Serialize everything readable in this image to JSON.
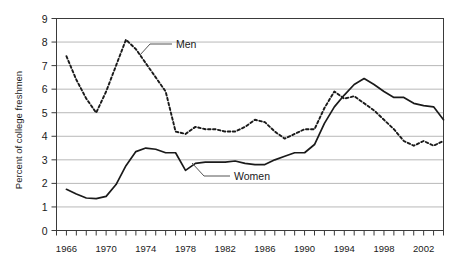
{
  "chart_data": {
    "type": "line",
    "title": "",
    "xlabel": "",
    "ylabel": "Percent of college freshmen",
    "xlim": [
      1965,
      2004
    ],
    "ylim": [
      0,
      9
    ],
    "yticks": [
      0,
      1,
      2,
      3,
      4,
      5,
      6,
      7,
      8,
      9
    ],
    "ytick_labels": [
      "0",
      "1",
      "2",
      "3",
      "4",
      "5",
      "6",
      "7",
      "8",
      "9"
    ],
    "xticks": [
      1966,
      1970,
      1974,
      1978,
      1982,
      1986,
      1990,
      1994,
      1998,
      2002
    ],
    "xtick_labels": [
      "1966",
      "1970",
      "1974",
      "1978",
      "1982",
      "1986",
      "1990",
      "1994",
      "1998",
      "2002"
    ],
    "xtick_minor_step": 1,
    "grid": "horizontal",
    "legend_position": "inline-annotations",
    "series": [
      {
        "name": "Men",
        "style": "dashed",
        "color": "#1a1a1a",
        "x": [
          1966,
          1967,
          1968,
          1969,
          1970,
          1971,
          1972,
          1973,
          1974,
          1975,
          1976,
          1977,
          1978,
          1979,
          1980,
          1981,
          1982,
          1983,
          1984,
          1985,
          1986,
          1987,
          1988,
          1989,
          1990,
          1991,
          1992,
          1993,
          1994,
          1995,
          1996,
          1997,
          1998,
          1999,
          2000,
          2001,
          2002,
          2003,
          2004
        ],
        "values": [
          7.4,
          6.4,
          5.6,
          5.0,
          5.9,
          7.0,
          8.1,
          7.7,
          7.1,
          6.5,
          5.9,
          4.2,
          4.1,
          4.4,
          4.3,
          4.3,
          4.2,
          4.2,
          4.4,
          4.7,
          4.6,
          4.2,
          3.9,
          4.1,
          4.3,
          4.3,
          5.2,
          5.9,
          5.6,
          5.7,
          5.4,
          5.1,
          4.7,
          4.3,
          3.8,
          3.6,
          3.8,
          3.6,
          3.8
        ]
      },
      {
        "name": "Women",
        "style": "solid",
        "color": "#1a1a1a",
        "x": [
          1966,
          1967,
          1968,
          1969,
          1970,
          1971,
          1972,
          1973,
          1974,
          1975,
          1976,
          1977,
          1978,
          1979,
          1980,
          1981,
          1982,
          1983,
          1984,
          1985,
          1986,
          1987,
          1988,
          1989,
          1990,
          1991,
          1992,
          1993,
          1994,
          1995,
          1996,
          1997,
          1998,
          1999,
          2000,
          2001,
          2002,
          2003,
          2004
        ],
        "values": [
          1.75,
          1.55,
          1.38,
          1.35,
          1.45,
          1.95,
          2.75,
          3.35,
          3.5,
          3.45,
          3.3,
          3.3,
          2.55,
          2.85,
          2.9,
          2.9,
          2.9,
          2.95,
          2.85,
          2.8,
          2.8,
          3.0,
          3.15,
          3.3,
          3.3,
          3.65,
          4.55,
          5.25,
          5.75,
          6.2,
          6.45,
          6.2,
          5.9,
          5.65,
          5.65,
          5.4,
          5.3,
          5.25,
          4.7
        ]
      }
    ],
    "annotations": [
      {
        "label": "Men",
        "x_px": 158,
        "y_px": 44
      },
      {
        "label": "Women",
        "x_px": 222,
        "y_px": 176
      }
    ]
  },
  "axis": {
    "y_title": "Percent of college freshmen"
  }
}
